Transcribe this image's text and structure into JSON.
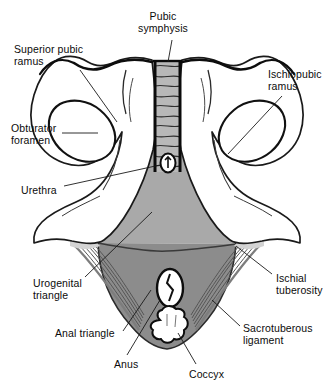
{
  "figure": {
    "type": "anatomical-diagram",
    "background_color": "#ffffff",
    "ink_color": "#111111"
  },
  "labels": [
    {
      "id": "pubic-symphysis",
      "text": "Pubic\nsymphysis",
      "x": 163,
      "y": 10,
      "align": "center"
    },
    {
      "id": "superior-pubic-ramus",
      "text": "Superior pubic\nramus",
      "x": 14,
      "y": 43,
      "align": "left"
    },
    {
      "id": "ischiopubic-ramus",
      "text": "Ischiopubic\nramus",
      "x": 268,
      "y": 68,
      "align": "left"
    },
    {
      "id": "obturator-foramen",
      "text": "Obturator\nforamen",
      "x": 11,
      "y": 122,
      "align": "left"
    },
    {
      "id": "urethra",
      "text": "Urethra",
      "x": 21,
      "y": 184,
      "align": "left"
    },
    {
      "id": "urogenital-triangle",
      "text": "Urogenital\ntriangle",
      "x": 33,
      "y": 277,
      "align": "left"
    },
    {
      "id": "ischial-tuberosity",
      "text": "Ischial\ntuberosity",
      "x": 276,
      "y": 272,
      "align": "left"
    },
    {
      "id": "anal-triangle",
      "text": "Anal triangle",
      "x": 55,
      "y": 327,
      "align": "left"
    },
    {
      "id": "sacrotuberous-ligament",
      "text": "Sacrotuberous\nligament",
      "x": 243,
      "y": 322,
      "align": "left"
    },
    {
      "id": "anus",
      "text": "Anus",
      "x": 114,
      "y": 358,
      "align": "left"
    },
    {
      "id": "coccyx",
      "text": "Coccyx",
      "x": 189,
      "y": 368,
      "align": "left"
    }
  ],
  "structures": {
    "urogenital_triangle": {
      "name": "Urogenital triangle",
      "fill": "#a8a8a8"
    },
    "anal_triangle": {
      "name": "Anal triangle",
      "fill": "#8d8d8d"
    },
    "bone": {
      "name": "Pelvic bone",
      "fill": "#ffffff"
    },
    "pubic_symphysis": {
      "name": "Pubic symphysis",
      "fill": "#b9b9b9",
      "striations": 11
    },
    "ligament_fibers": {
      "name": "Sacrotuberous ligament fibers",
      "fill": "#9a9a9a"
    },
    "urethra": {
      "name": "Urethra",
      "fill": "#ffffff"
    },
    "anus": {
      "name": "Anus",
      "fill": "#ffffff"
    },
    "coccyx": {
      "name": "Coccyx",
      "fill": "#ffffff"
    }
  }
}
